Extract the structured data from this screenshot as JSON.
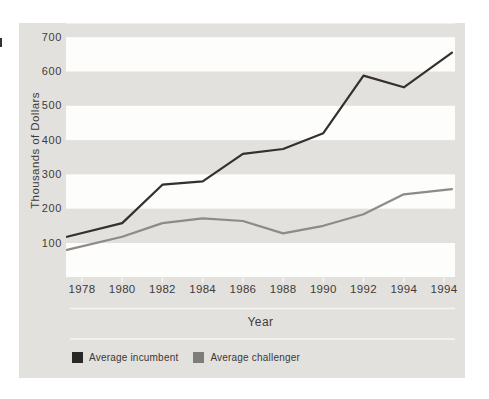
{
  "chart_data": {
    "type": "line",
    "title": "",
    "xlabel": "Year",
    "ylabel": "Thousands of Dollars",
    "x_labels": [
      "1978",
      "1980",
      "1982",
      "1984",
      "1986",
      "1988",
      "1990",
      "1992",
      "1994",
      "1994"
    ],
    "yticks": [
      700,
      600,
      500,
      400,
      300,
      200,
      100
    ],
    "ylim": [
      0,
      740
    ],
    "grid": "alternating horizontal gray bands",
    "gray_bands": [
      [
        100,
        200
      ],
      [
        300,
        400
      ],
      [
        500,
        600
      ],
      [
        700,
        740
      ]
    ],
    "legend_position": "bottom-left",
    "series": [
      {
        "name": "Average incumbent",
        "color": "#34302c",
        "values": [
          118,
          158,
          270,
          280,
          360,
          374,
          420,
          588,
          554,
          655
        ]
      },
      {
        "name": "Average challenger",
        "color": "#8e8a86",
        "values": [
          80,
          118,
          158,
          172,
          164,
          128,
          150,
          184,
          242,
          257
        ]
      }
    ]
  },
  "colors": {
    "figure_background": "#e3e1de",
    "plot_background": "#fdfdfc",
    "stripe": "#e3e1de",
    "rule": "#f7f6f3",
    "tick": "#f7f6f3",
    "text": "#3e3c3a",
    "legend_swatch_incumbent": "#2a2724",
    "legend_swatch_challenger": "#7f7c79"
  }
}
